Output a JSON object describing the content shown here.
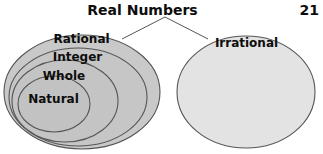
{
  "page": {
    "number": "21",
    "title": "Real Numbers"
  },
  "diagram": {
    "type": "venn-nested-sets",
    "groups": [
      {
        "id": "rational-group",
        "label": "Rational",
        "fill": "#c9c9c9",
        "stroke": "#555555",
        "ellipse": {
          "cx": 82,
          "cy": 92,
          "rx": 78,
          "ry": 57
        }
      },
      {
        "id": "integer-group",
        "label": "Integer",
        "fill": "#c6c6c6",
        "stroke": "#555555",
        "ellipse": {
          "cx": 78,
          "cy": 97,
          "rx": 69,
          "ry": 49
        }
      },
      {
        "id": "whole-group",
        "label": "Whole",
        "fill": "#c4c4c4",
        "stroke": "#555555",
        "ellipse": {
          "cx": 65,
          "cy": 101,
          "rx": 53,
          "ry": 41
        }
      },
      {
        "id": "natural-group",
        "label": "Natural",
        "fill": "#c2c2c2",
        "stroke": "#555555",
        "ellipse": {
          "cx": 54,
          "cy": 104,
          "rx": 36,
          "ry": 28
        }
      },
      {
        "id": "irrational-group",
        "label": "Irrational",
        "fill": "#e3e3e3",
        "stroke": "#555555",
        "ellipse": {
          "cx": 246,
          "cy": 92,
          "rx": 69,
          "ry": 56
        }
      }
    ],
    "leader_lines": [
      {
        "id": "leader-left",
        "x1": 165,
        "y1": 17,
        "x2": 122,
        "y2": 39
      },
      {
        "id": "leader-right",
        "x1": 165,
        "y1": 17,
        "x2": 208,
        "y2": 39
      }
    ],
    "colors": {
      "background": "#ffffff",
      "text": "#0d0d0d",
      "line": "#555555"
    }
  }
}
